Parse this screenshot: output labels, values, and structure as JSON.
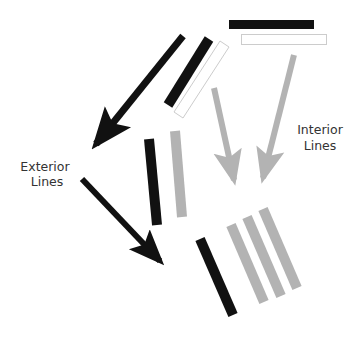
{
  "labels": {
    "exterior_line1": "Exterior",
    "exterior_line2": "Lines",
    "interior_line1": "Interior",
    "interior_line2": "Lines"
  },
  "colors": {
    "exterior": "#111111",
    "interior": "#b3b3b3",
    "outline": "#cccccc",
    "background": "#ffffff",
    "text": "#333333"
  }
}
